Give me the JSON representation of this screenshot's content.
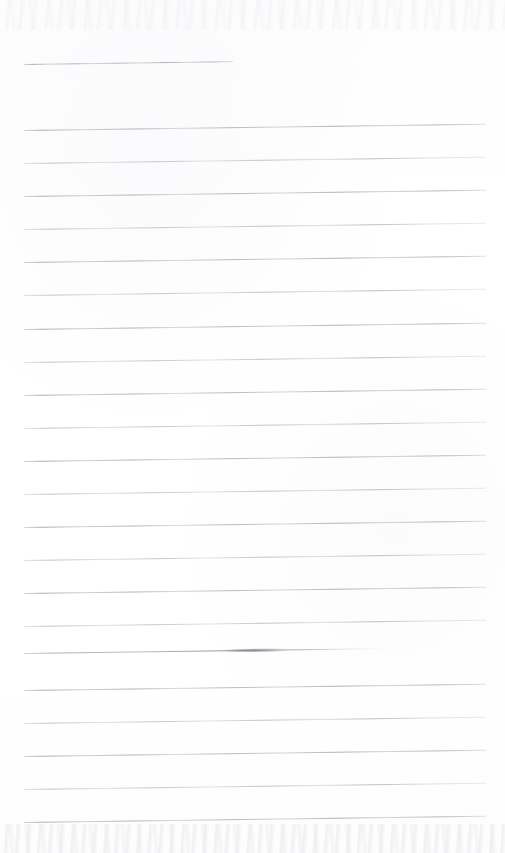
{
  "document": {
    "kind": "scanned-ruled-notebook-page",
    "page_width": 505,
    "page_height": 853,
    "background_color": "#fefefe",
    "rule_color": "#b8b8be",
    "ink_dark_color": "#8a8a95",
    "content_text": "",
    "has_handwriting": false,
    "notes": "Blank lined paper scan; no text, headings, or marks other than the printed rules and one ink smudge."
  },
  "geometry": {
    "rule_left_x": 24,
    "rule_right_x": 486,
    "rule_spacing_px": 33,
    "skew_degrees": -0.78,
    "header_rule_count": 1,
    "body_rule_count": 22,
    "total_rule_count": 23
  },
  "rules": [
    {
      "id": "header-rule",
      "y": 64,
      "x_start": 24,
      "x_end": 233,
      "style": "normal",
      "group": "header"
    },
    {
      "id": "body-rule-1",
      "y": 130,
      "x_start": 24,
      "x_end": 486,
      "style": "normal",
      "group": "body"
    },
    {
      "id": "body-rule-2",
      "y": 163,
      "x_start": 24,
      "x_end": 486,
      "style": "faint",
      "group": "body"
    },
    {
      "id": "body-rule-3",
      "y": 196,
      "x_start": 24,
      "x_end": 486,
      "style": "normal",
      "group": "body"
    },
    {
      "id": "body-rule-4",
      "y": 229,
      "x_start": 24,
      "x_end": 486,
      "style": "faint",
      "group": "body"
    },
    {
      "id": "body-rule-5",
      "y": 262,
      "x_start": 24,
      "x_end": 486,
      "style": "normal",
      "group": "body"
    },
    {
      "id": "body-rule-6",
      "y": 295,
      "x_start": 24,
      "x_end": 486,
      "style": "faint",
      "group": "body"
    },
    {
      "id": "body-rule-7",
      "y": 329,
      "x_start": 24,
      "x_end": 486,
      "style": "normal",
      "group": "body"
    },
    {
      "id": "body-rule-8",
      "y": 362,
      "x_start": 24,
      "x_end": 486,
      "style": "faint",
      "group": "body"
    },
    {
      "id": "body-rule-9",
      "y": 395,
      "x_start": 24,
      "x_end": 486,
      "style": "normal",
      "group": "body"
    },
    {
      "id": "body-rule-10",
      "y": 428,
      "x_start": 24,
      "x_end": 486,
      "style": "faint",
      "group": "body"
    },
    {
      "id": "body-rule-11",
      "y": 461,
      "x_start": 24,
      "x_end": 486,
      "style": "normal",
      "group": "body"
    },
    {
      "id": "body-rule-12",
      "y": 494,
      "x_start": 24,
      "x_end": 486,
      "style": "faint",
      "group": "body"
    },
    {
      "id": "body-rule-13",
      "y": 527,
      "x_start": 24,
      "x_end": 486,
      "style": "normal",
      "group": "body"
    },
    {
      "id": "body-rule-14",
      "y": 560,
      "x_start": 24,
      "x_end": 486,
      "style": "faint",
      "group": "body"
    },
    {
      "id": "body-rule-15",
      "y": 593,
      "x_start": 24,
      "x_end": 486,
      "style": "normal",
      "group": "body"
    },
    {
      "id": "body-rule-16",
      "y": 626,
      "x_start": 24,
      "x_end": 486,
      "style": "faint",
      "group": "body"
    },
    {
      "id": "body-rule-17",
      "y": 653,
      "x_start": 24,
      "x_end": 396,
      "style": "smudged",
      "group": "body"
    },
    {
      "id": "body-rule-18",
      "y": 690,
      "x_start": 24,
      "x_end": 486,
      "style": "normal",
      "group": "body"
    },
    {
      "id": "body-rule-19",
      "y": 723,
      "x_start": 24,
      "x_end": 486,
      "style": "faint",
      "group": "body"
    },
    {
      "id": "body-rule-20",
      "y": 756,
      "x_start": 24,
      "x_end": 486,
      "style": "normal",
      "group": "body"
    },
    {
      "id": "body-rule-21",
      "y": 789,
      "x_start": 24,
      "x_end": 486,
      "style": "faint",
      "group": "body"
    },
    {
      "id": "body-rule-22",
      "y": 822,
      "x_start": 24,
      "x_end": 486,
      "style": "normal",
      "group": "body"
    }
  ]
}
